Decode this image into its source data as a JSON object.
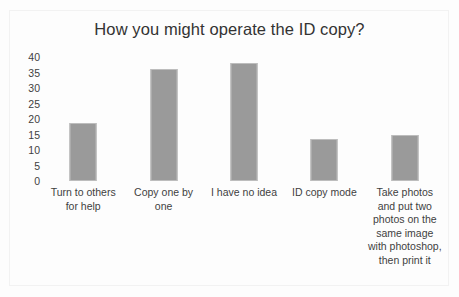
{
  "chart_data": {
    "type": "bar",
    "title": "How you might operate the ID copy?",
    "xlabel": "",
    "ylabel": "",
    "categories": [
      "Turn to others for help",
      "Copy one by one",
      "I have no idea",
      "ID copy mode",
      "Take photos and put two photos on the same image with photoshop, then print it"
    ],
    "values": [
      18,
      35,
      37,
      13,
      14.5
    ],
    "ylim": [
      0,
      40
    ],
    "yticks": [
      0,
      5,
      10,
      15,
      20,
      25,
      30,
      35,
      40
    ],
    "ytick_labels": [
      "0",
      "5",
      "10",
      "15",
      "20",
      "25",
      "30",
      "35",
      "40"
    ],
    "grid": false,
    "legend": false,
    "bar_color": "#9a9a9a",
    "background_color": "#fdfdfd",
    "text_color": "#3f3f3f"
  }
}
